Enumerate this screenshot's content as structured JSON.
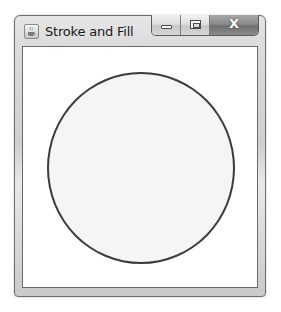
{
  "window": {
    "title": "Stroke and Fill",
    "app_icon": "java-coffee-cup-icon",
    "caption_buttons": {
      "minimize": {
        "icon": "minimize-icon"
      },
      "maximize": {
        "icon": "maximize-icon"
      },
      "close": {
        "icon": "close-icon",
        "glyph": "X"
      }
    }
  },
  "canvas": {
    "shape": "circle",
    "stroke_color": "#3c3c3c",
    "fill_color": "#f5f5f5"
  }
}
